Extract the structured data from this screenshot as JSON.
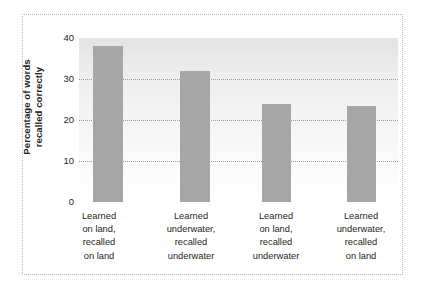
{
  "chart_data": {
    "type": "bar",
    "title": "",
    "xlabel": "",
    "ylabel": "Percentage of words recalled correctly",
    "ylabel_lines": [
      "Percentage of words",
      "recalled correctly"
    ],
    "ylim": [
      0,
      40
    ],
    "yticks": [
      0,
      10,
      20,
      30,
      40
    ],
    "ytick_labels": [
      "0",
      "10",
      "20",
      "30",
      "40"
    ],
    "grid": true,
    "gridlines_at": [
      10,
      20,
      30,
      40
    ],
    "legend": null,
    "categories": [
      "Learned on land, recalled on land",
      "Learned underwater, recalled underwater",
      "Learned on land, recalled underwater",
      "Learned underwater, recalled on land"
    ],
    "category_lines": [
      [
        "Learned",
        "on land,",
        "recalled",
        "on land"
      ],
      [
        "Learned",
        "underwater,",
        "recalled",
        "underwater"
      ],
      [
        "Learned",
        "on land,",
        "recalled",
        "underwater"
      ],
      [
        "Learned",
        "underwater,",
        "recalled",
        "on land"
      ]
    ],
    "values": [
      38,
      32,
      24,
      23.5
    ],
    "bar_color": "#a6a6a6",
    "plot_bg_top": "#e3e3e3",
    "plot_bg_bottom": "#ffffff",
    "grid_color": "#9a9a9a",
    "text_color": "#231f20",
    "frame_color": "#b9b9b9"
  }
}
